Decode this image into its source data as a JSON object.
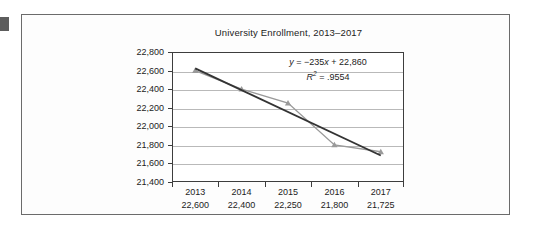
{
  "figure": {
    "title": "University Enrollment, 2013–2017"
  },
  "annotation": {
    "equation_y": "y",
    "equation_body": " = −235x + 22,860",
    "equation_full": "y = −235x + 22,860",
    "r_symbol": "R",
    "r_exponent": "2",
    "r_value": " = .9554",
    "r2_full": "R2 = .9554"
  },
  "axis": {
    "y_ticks": [
      "22,800",
      "22,600",
      "22,400",
      "22,200",
      "22,000",
      "21,800",
      "21,600",
      "21,400"
    ],
    "y_tick_values": [
      22800,
      22600,
      22400,
      22200,
      22000,
      21800,
      21600,
      21400
    ]
  },
  "table": {
    "years": [
      "2013",
      "2014",
      "2015",
      "2016",
      "2017"
    ],
    "values": [
      "22,600",
      "22,400",
      "22,250",
      "21,800",
      "21,725"
    ]
  },
  "colors": {
    "series_line": "#9a9a9a",
    "trend_line": "#333333",
    "gridline": "#b9b9b9",
    "axis": "#3d3d3d",
    "frame": "#6b6b6b",
    "text": "#1c1c1c"
  },
  "chart_data": {
    "type": "line",
    "title": "University Enrollment, 2013–2017",
    "xlabel": "",
    "ylabel": "",
    "categories": [
      "2013",
      "2014",
      "2015",
      "2016",
      "2017"
    ],
    "x": [
      2013,
      2014,
      2015,
      2016,
      2017
    ],
    "ylim": [
      21400,
      22800
    ],
    "ytick_step": 200,
    "grid": true,
    "legend": "none",
    "series": [
      {
        "name": "Enrollment",
        "values": [
          22600,
          22400,
          22250,
          21800,
          21725
        ],
        "marker": "triangle",
        "color": "#9a9a9a"
      },
      {
        "name": "Linear trendline",
        "type": "trendline",
        "equation": "y = −235x + 22,860",
        "slope": -235,
        "intercept": 22860,
        "r_squared": 0.9554,
        "values": [
          22625,
          22390,
          22155,
          21920,
          21685
        ],
        "color": "#333333"
      }
    ],
    "annotations": [
      "y = −235x + 22,860",
      "R² = .9554"
    ]
  }
}
